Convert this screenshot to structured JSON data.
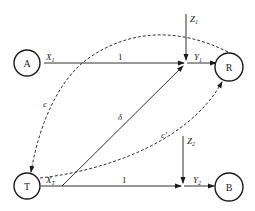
{
  "diagram": {
    "type": "path-diagram",
    "nodes": {
      "A": {
        "label": "A"
      },
      "R": {
        "label": "R"
      },
      "T": {
        "label": "T"
      },
      "B": {
        "label": "B"
      }
    },
    "labels": {
      "x1": "X",
      "x1_sub": "1",
      "xt": "X",
      "xt_sub": "T",
      "y1": "Y",
      "y1_sub": "1",
      "y2": "Y",
      "y2_sub": "2",
      "z1": "Z",
      "z1_sub": "1",
      "z2": "Z",
      "z2_sub": "2",
      "weight_top": "1",
      "weight_bottom": "1",
      "delta": "δ",
      "c": "c",
      "c_prime": "c′"
    },
    "edges": [
      {
        "from": "A",
        "to": "R",
        "style": "solid",
        "label": "1"
      },
      {
        "from": "T",
        "to": "B",
        "style": "solid",
        "label": "1"
      },
      {
        "from": "T",
        "to": "R",
        "style": "solid",
        "label": "δ"
      },
      {
        "from": "Z1",
        "to": "Y1",
        "style": "solid"
      },
      {
        "from": "Z2",
        "to": "Y2",
        "style": "solid"
      },
      {
        "from": "R",
        "to": "T",
        "style": "dashed",
        "label": "c"
      },
      {
        "from": "T",
        "to": "R",
        "style": "dashed",
        "label": "c′"
      }
    ]
  }
}
